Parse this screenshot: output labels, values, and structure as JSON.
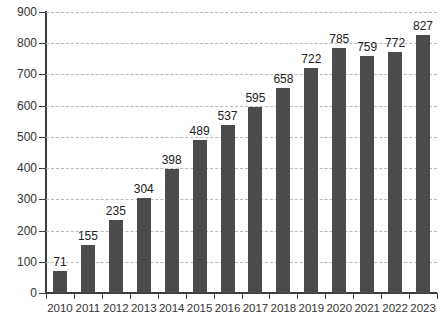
{
  "chart_data": {
    "type": "bar",
    "title": "",
    "subtitle": "",
    "xlabel": "",
    "ylabel": "",
    "categories": [
      "2010",
      "2011",
      "2012",
      "2013",
      "2014",
      "2015",
      "2016",
      "2017",
      "2018",
      "2019",
      "2020",
      "2021",
      "2022",
      "2023"
    ],
    "values": [
      71,
      155,
      235,
      304,
      398,
      489,
      537,
      595,
      658,
      722,
      785,
      759,
      772,
      827
    ],
    "data_labels": [
      "71",
      "155",
      "235",
      "304",
      "398",
      "489",
      "537",
      "595",
      "658",
      "722",
      "785",
      "759",
      "772",
      "827"
    ],
    "ylim": [
      0,
      900
    ],
    "ytick_values": [
      0,
      100,
      200,
      300,
      400,
      500,
      600,
      700,
      800,
      900
    ],
    "ytick_labels": [
      "0",
      "100",
      "200",
      "300",
      "400",
      "500",
      "600",
      "700",
      "800",
      "900"
    ],
    "grid": true,
    "grid_axis": "y",
    "grid_style": "dashed",
    "grid_color": "#b9b9b9",
    "legend": null,
    "legend_position": "none",
    "bar_color": "#4b4b4b",
    "axis_color": "#3d3d3d",
    "background_color": "#ffffff",
    "label_color": "#333333",
    "annotations": []
  }
}
